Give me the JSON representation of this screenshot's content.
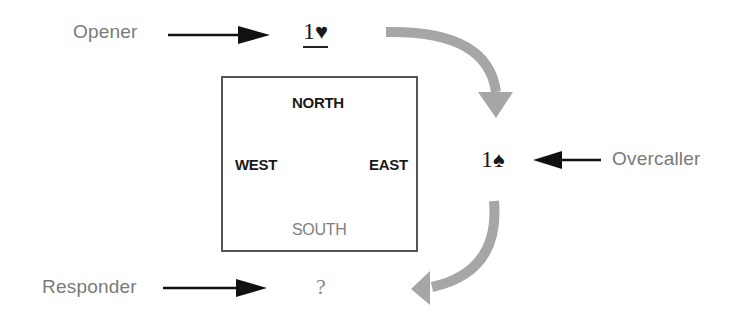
{
  "labels": {
    "opener": "Opener",
    "overcaller": "Overcaller",
    "responder": "Responder"
  },
  "bids": {
    "opener": {
      "level": "1",
      "suit": "♥",
      "suit_name": "hearts"
    },
    "overcaller": {
      "level": "1",
      "suit": "♠",
      "suit_name": "spades"
    },
    "responder": {
      "text": "?"
    }
  },
  "table": {
    "north": "NORTH",
    "west": "WEST",
    "east": "EAST",
    "south": "SOUTH"
  },
  "colors": {
    "curved_arrow": "#a6a6a6",
    "pointer_arrow": "#111111",
    "role_text": "#7a7a7a",
    "south_text": "#808080"
  }
}
